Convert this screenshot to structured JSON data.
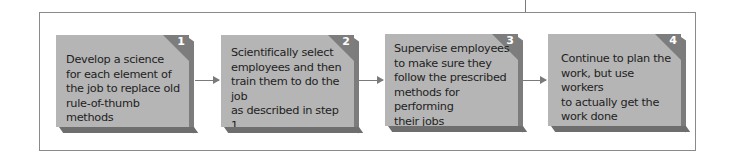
{
  "diagram": {
    "type": "process-flow",
    "steps": [
      {
        "number": "1",
        "text": "Develop a science\nfor each element of\nthe job to replace old\nrule-of-thumb methods"
      },
      {
        "number": "2",
        "text": "Scientifically select\nemployees and then\ntrain them to do the job\nas described in step 1"
      },
      {
        "number": "3",
        "text": "Supervise employees\nto make sure they\nfollow the prescribed\nmethods for performing\ntheir jobs"
      },
      {
        "number": "4",
        "text": "Continue to plan the\nwork, but use workers\nto actually get the\nwork done"
      }
    ],
    "arrows": [
      {
        "from": "1",
        "to": "2"
      },
      {
        "from": "2",
        "to": "3"
      },
      {
        "from": "3",
        "to": "4"
      }
    ],
    "colors": {
      "box_face": "#b5b5b5",
      "box_side": "#7c7c7c",
      "box_bottom": "#6e6e6e",
      "corner": "#7d7d7d",
      "number": "#ffffff",
      "text": "#1e1e1e",
      "arrow": "#7a7a7a",
      "frame": "#8a8a8a"
    }
  }
}
